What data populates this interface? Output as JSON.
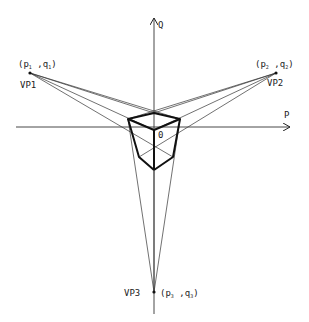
{
  "diagram": {
    "type": "three-point-perspective-projection",
    "axes": {
      "horizontal_label": "P",
      "vertical_label": "Q",
      "origin_label": "0"
    },
    "vanishing_points": [
      {
        "id": "VP1",
        "label": "VP1",
        "coord_open": "(p",
        "sub1": "1",
        "sep": " ,q",
        "sub2": "1",
        "coord_close": ")"
      },
      {
        "id": "VP2",
        "label": "VP2",
        "coord_open": "(p",
        "sub1": "2",
        "sep": " ,q",
        "sub2": "2",
        "coord_close": ")"
      },
      {
        "id": "VP3",
        "label": "VP3",
        "coord_open": "(p",
        "sub1": "3",
        "sep": " ,q",
        "sub2": "3",
        "coord_close": ")"
      }
    ],
    "colors": {
      "line": "#222222",
      "background": "#ffffff"
    }
  }
}
